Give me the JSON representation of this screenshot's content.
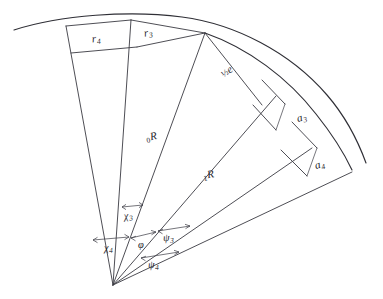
{
  "figure": {
    "type": "geometric-diagram",
    "background_color": "#ffffff",
    "line_color": "#3a3a42",
    "labels": {
      "r4": {
        "text": "r",
        "subscript": "4",
        "name": "radial-segment-r4"
      },
      "r3": {
        "text": "r",
        "subscript": "3",
        "name": "radial-segment-r3"
      },
      "half_e": {
        "prefix": "½",
        "text": "e",
        "name": "chord-half-e"
      },
      "R0": {
        "presubscript": "0",
        "text": "R",
        "name": "radius-R0"
      },
      "R1": {
        "presubscript": "1",
        "text": "R",
        "name": "radius-R1"
      },
      "a3": {
        "text": "a",
        "subscript": "3",
        "name": "offset-a3"
      },
      "a4": {
        "text": "a",
        "subscript": "4",
        "name": "offset-a4"
      },
      "chi3": {
        "text": "χ",
        "subscript": "3",
        "name": "angle-chi3"
      },
      "chi4": {
        "text": "χ",
        "subscript": "4",
        "name": "angle-chi4"
      },
      "phi": {
        "text": "φ",
        "subscript": "",
        "name": "angle-phi"
      },
      "psi3": {
        "text": "ψ",
        "subscript": "3",
        "name": "angle-psi3"
      },
      "psi4": {
        "text": "ψ",
        "subscript": "4",
        "name": "angle-psi4"
      }
    }
  }
}
